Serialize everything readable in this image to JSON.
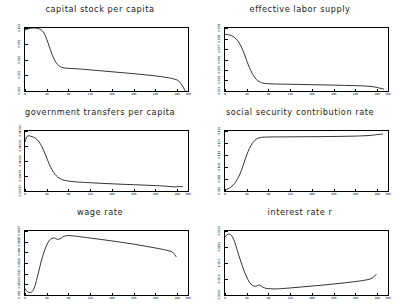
{
  "figure": {
    "rows": 3,
    "cols": 2,
    "background": "#ffffff",
    "line_color": "#000000",
    "frame_color": "#000000"
  },
  "chart_data": [
    {
      "type": "line",
      "title": "capital stock per capita",
      "xlabel": "",
      "ylabel": "",
      "xlim": [
        0,
        300
      ],
      "ylim": [
        0.0,
        1.0
      ],
      "grid": false,
      "legend": "none",
      "xticks": [
        "0",
        "40",
        "80",
        "120",
        "160",
        "200",
        "240",
        "280",
        "300"
      ],
      "xtick_values": [
        0,
        40,
        80,
        120,
        160,
        200,
        240,
        280,
        300
      ],
      "yticks": [
        "0.000",
        "0.025",
        "0.050",
        "0.075",
        "0.100"
      ],
      "ytick_values": [
        0.0,
        0.25,
        0.5,
        0.75,
        1.0
      ],
      "x": [
        0,
        5,
        10,
        15,
        20,
        25,
        30,
        35,
        40,
        45,
        50,
        55,
        60,
        65,
        70,
        75,
        80,
        90,
        100,
        120,
        140,
        160,
        180,
        200,
        220,
        240,
        260,
        270,
        280,
        285,
        290,
        293,
        295
      ],
      "values": [
        0.97,
        0.985,
        0.995,
        1.0,
        0.998,
        0.99,
        0.97,
        0.92,
        0.82,
        0.7,
        0.58,
        0.48,
        0.42,
        0.385,
        0.37,
        0.363,
        0.36,
        0.355,
        0.35,
        0.335,
        0.32,
        0.305,
        0.29,
        0.275,
        0.258,
        0.24,
        0.215,
        0.2,
        0.175,
        0.14,
        0.08,
        0.03,
        0.0
      ]
    },
    {
      "type": "line",
      "title": "effective labor supply",
      "xlabel": "",
      "ylabel": "",
      "xlim": [
        0,
        300
      ],
      "ylim": [
        0.0,
        1.0
      ],
      "grid": false,
      "legend": "none",
      "xticks": [
        "0",
        "40",
        "80",
        "120",
        "160",
        "200",
        "240",
        "280",
        "300"
      ],
      "xtick_values": [
        0,
        40,
        80,
        120,
        160,
        200,
        240,
        280,
        300
      ],
      "yticks": [
        "0.573",
        "0.574",
        "0.575",
        "0.576",
        "0.577",
        "0.578",
        "0.579"
      ],
      "ytick_values": [
        0.0,
        0.1667,
        0.3333,
        0.5,
        0.6667,
        0.8333,
        1.0
      ],
      "x": [
        0,
        5,
        10,
        15,
        20,
        25,
        30,
        35,
        40,
        45,
        50,
        55,
        60,
        65,
        70,
        80,
        90,
        100,
        120,
        140,
        160,
        180,
        200,
        220,
        240,
        260,
        275,
        285,
        292
      ],
      "values": [
        0.9,
        0.895,
        0.885,
        0.865,
        0.83,
        0.78,
        0.7,
        0.6,
        0.48,
        0.37,
        0.28,
        0.21,
        0.165,
        0.14,
        0.125,
        0.115,
        0.112,
        0.11,
        0.107,
        0.104,
        0.1,
        0.097,
        0.093,
        0.089,
        0.085,
        0.078,
        0.065,
        0.045,
        0.03
      ]
    },
    {
      "type": "line",
      "title": "government transfers per capita",
      "xlabel": "",
      "ylabel": "",
      "xlim": [
        0,
        300
      ],
      "ylim": [
        0.0,
        1.0
      ],
      "grid": false,
      "legend": "none",
      "xticks": [
        "0",
        "40",
        "80",
        "120",
        "160",
        "200",
        "240",
        "280",
        "300"
      ],
      "xtick_values": [
        0,
        40,
        80,
        120,
        160,
        200,
        240,
        280,
        300
      ],
      "yticks": [
        "0.00717",
        "0.00974",
        "0.01000",
        "0.01024",
        "0.01050"
      ],
      "ytick_values": [
        0.0,
        0.25,
        0.5,
        0.75,
        1.0
      ],
      "x": [
        0,
        3,
        6,
        10,
        15,
        20,
        25,
        30,
        35,
        40,
        45,
        50,
        55,
        60,
        65,
        70,
        80,
        90,
        100,
        120,
        140,
        160,
        180,
        200,
        220,
        240,
        260,
        275,
        285,
        290
      ],
      "values": [
        0.82,
        0.9,
        0.92,
        0.915,
        0.9,
        0.875,
        0.83,
        0.76,
        0.66,
        0.55,
        0.44,
        0.35,
        0.28,
        0.235,
        0.205,
        0.185,
        0.165,
        0.155,
        0.148,
        0.138,
        0.128,
        0.12,
        0.112,
        0.105,
        0.098,
        0.09,
        0.08,
        0.068,
        0.075,
        0.07
      ]
    },
    {
      "type": "line",
      "title": "social security contribution rate",
      "xlabel": "",
      "ylabel": "",
      "xlim": [
        0,
        300
      ],
      "ylim": [
        0.0,
        1.0
      ],
      "grid": false,
      "legend": "none",
      "xticks": [
        "0",
        "40",
        "80",
        "120",
        "160",
        "200",
        "240",
        "280",
        "300"
      ],
      "xtick_values": [
        0,
        40,
        80,
        120,
        160,
        200,
        240,
        280,
        300
      ],
      "yticks": [
        "0.090",
        "0.098",
        "0.106",
        "0.114",
        "0.122",
        "0.130"
      ],
      "ytick_values": [
        0.0,
        0.2,
        0.4,
        0.6,
        0.8,
        1.0
      ],
      "x": [
        0,
        5,
        10,
        15,
        20,
        25,
        30,
        35,
        40,
        45,
        50,
        55,
        60,
        65,
        70,
        80,
        100,
        120,
        150,
        180,
        210,
        240,
        265,
        280,
        290
      ],
      "values": [
        0.02,
        0.035,
        0.06,
        0.1,
        0.155,
        0.235,
        0.34,
        0.47,
        0.6,
        0.71,
        0.79,
        0.845,
        0.875,
        0.89,
        0.897,
        0.9,
        0.902,
        0.903,
        0.905,
        0.907,
        0.91,
        0.915,
        0.925,
        0.94,
        0.95
      ]
    },
    {
      "type": "line",
      "title": "wage rate",
      "xlabel": "",
      "ylabel": "",
      "xlim": [
        0,
        300
      ],
      "ylim": [
        0.0,
        1.0
      ],
      "grid": false,
      "legend": "none",
      "xticks": [
        "0",
        "40",
        "80",
        "120",
        "160",
        "200",
        "240",
        "280",
        "300"
      ],
      "xtick_values": [
        0,
        40,
        80,
        120,
        160,
        200,
        240,
        280,
        300
      ],
      "yticks": [
        "0.049",
        "0.0650",
        "0.0742",
        "0.0801",
        "0.086",
        "0.0888",
        "0.0907"
      ],
      "ytick_values": [
        0.0,
        0.1667,
        0.3333,
        0.5,
        0.6667,
        0.8333,
        1.0
      ],
      "x": [
        0,
        4,
        8,
        12,
        16,
        20,
        25,
        30,
        35,
        40,
        45,
        50,
        55,
        58,
        62,
        66,
        70,
        75,
        80,
        90,
        100,
        120,
        140,
        160,
        180,
        200,
        220,
        240,
        255,
        265,
        272,
        278
      ],
      "values": [
        0.1,
        0.055,
        0.04,
        0.045,
        0.09,
        0.19,
        0.36,
        0.53,
        0.67,
        0.78,
        0.855,
        0.885,
        0.89,
        0.875,
        0.87,
        0.885,
        0.91,
        0.925,
        0.928,
        0.922,
        0.912,
        0.89,
        0.868,
        0.845,
        0.82,
        0.795,
        0.765,
        0.735,
        0.71,
        0.69,
        0.665,
        0.6
      ]
    },
    {
      "type": "line",
      "title": "interest rate r",
      "xlabel": "",
      "ylabel": "",
      "xlim": [
        0,
        300
      ],
      "ylim": [
        0.0,
        1.0
      ],
      "grid": false,
      "legend": "none",
      "xticks": [
        "0",
        "40",
        "80",
        "120",
        "160",
        "200",
        "240",
        "280",
        "300"
      ],
      "xtick_values": [
        0,
        40,
        80,
        120,
        160,
        200,
        240,
        280,
        300
      ],
      "yticks": [
        "0.0000",
        "5.0E-3",
        "1.0E-2",
        "0.0150",
        "0.0200"
      ],
      "ytick_values": [
        0.0,
        0.25,
        0.5,
        0.75,
        1.0
      ],
      "x": [
        0,
        4,
        8,
        12,
        16,
        20,
        25,
        30,
        35,
        40,
        45,
        50,
        55,
        58,
        62,
        66,
        70,
        75,
        80,
        90,
        100,
        120,
        140,
        160,
        180,
        200,
        220,
        240,
        255,
        265,
        272,
        278
      ],
      "values": [
        0.9,
        0.945,
        0.95,
        0.93,
        0.87,
        0.77,
        0.63,
        0.5,
        0.38,
        0.28,
        0.2,
        0.155,
        0.135,
        0.14,
        0.155,
        0.145,
        0.12,
        0.105,
        0.1,
        0.095,
        0.098,
        0.11,
        0.125,
        0.14,
        0.155,
        0.172,
        0.19,
        0.21,
        0.228,
        0.245,
        0.27,
        0.32
      ]
    }
  ]
}
